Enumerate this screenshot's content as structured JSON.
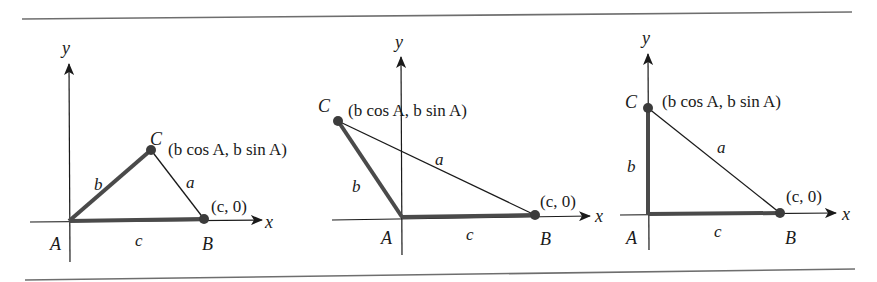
{
  "figure": {
    "colors": {
      "thick_sides": "#4a4a4a",
      "thin_side": "#1a1a1a",
      "axes": "#1a1a1a",
      "points": "#3c3c3c",
      "rules": "#6e6e6e",
      "text": "#1a1a1a"
    },
    "panels": [
      {
        "id": "acute",
        "axis_labels": {
          "x": "x",
          "y": "y"
        },
        "vertices": {
          "A": "A",
          "B": "B",
          "C": "C"
        },
        "sides": {
          "a": "a",
          "b": "b",
          "c": "c"
        },
        "coords": {
          "B": "(c, 0)",
          "C": "(b cos A, b sin A)"
        }
      },
      {
        "id": "obtuse",
        "axis_labels": {
          "x": "x",
          "y": "y"
        },
        "vertices": {
          "A": "A",
          "B": "B",
          "C": "C"
        },
        "sides": {
          "a": "a",
          "b": "b",
          "c": "c"
        },
        "coords": {
          "B": "(c, 0)",
          "C": "(b cos A, b sin A)"
        }
      },
      {
        "id": "right",
        "axis_labels": {
          "x": "x",
          "y": "y"
        },
        "vertices": {
          "A": "A",
          "B": "B",
          "C": "C"
        },
        "sides": {
          "a": "a",
          "b": "b",
          "c": "c"
        },
        "coords": {
          "B": "(c, 0)",
          "C": "(b cos A, b sin A)"
        }
      }
    ]
  }
}
